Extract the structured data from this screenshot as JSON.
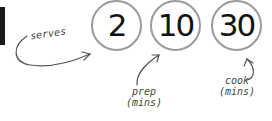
{
  "recipe_info": {
    "serves": {
      "value": "2",
      "label": "serves"
    },
    "prep": {
      "value": "10",
      "label_line1": "prep",
      "label_line2": "(mins)"
    },
    "cook": {
      "value": "30",
      "label_line1": "cook",
      "label_line2": "(mins)"
    }
  },
  "colors": {
    "circle_border": "#9a9a9a",
    "number_text": "#111111",
    "annotation_text": "#444444",
    "side_bar": "#1a1a1a"
  }
}
